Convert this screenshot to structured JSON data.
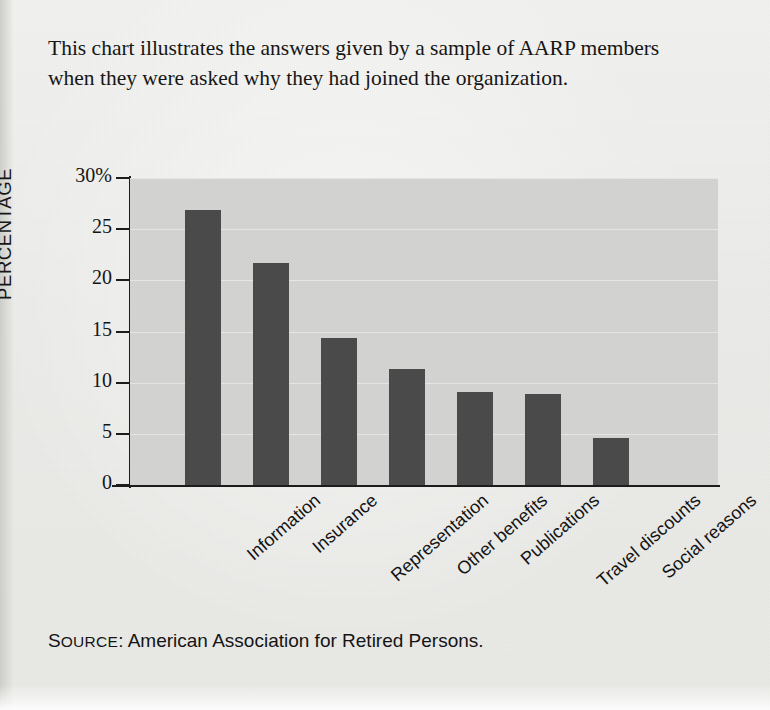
{
  "caption": "This chart illustrates the answers given by a sample of AARP members when they were asked why they had joined the organization.",
  "source": {
    "label_caps": "S",
    "label_rest": "OURCE",
    "colon": ":",
    "text": "American Association for Retired Persons.",
    "full": "SOURCE: American Association for Retired Persons."
  },
  "colors": {
    "bar": "#4b4b4b",
    "plot_background": "#d4d4d2",
    "page_background": "#ecece9",
    "axis": "#1d1d1d",
    "text": "#151515"
  },
  "chart_data": {
    "type": "bar",
    "title": "",
    "xlabel": "",
    "ylabel": "PERCENTAGE",
    "categories": [
      "Information",
      "Insurance",
      "Representation",
      "Other benefits",
      "Publications",
      "Travel discounts",
      "Social reasons"
    ],
    "values": [
      26.9,
      21.7,
      14.4,
      11.3,
      9.1,
      8.9,
      4.6
    ],
    "ylim": [
      0,
      30
    ],
    "yticks": [
      0,
      5,
      10,
      15,
      20,
      25,
      30
    ],
    "ytick_labels": [
      "0",
      "5",
      "10",
      "15",
      "20",
      "25",
      "30%"
    ],
    "grid": true,
    "legend": "none",
    "units": "percent"
  }
}
